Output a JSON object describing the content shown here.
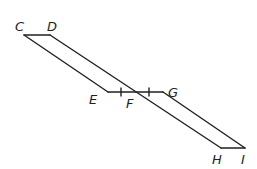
{
  "diagram": {
    "labels": {
      "C": "C",
      "D": "D",
      "E": "E",
      "F": "F",
      "G": "G",
      "H": "H",
      "I": "I"
    },
    "points": {
      "C": [
        24,
        35
      ],
      "D": [
        50,
        35
      ],
      "E": [
        108,
        92
      ],
      "F": [
        133,
        92
      ],
      "G": [
        163,
        92
      ],
      "H": [
        221,
        148
      ],
      "I": [
        245,
        148
      ]
    },
    "segments": [
      [
        "C",
        "D"
      ],
      [
        "C",
        "E"
      ],
      [
        "E",
        "G"
      ],
      [
        "D",
        "H"
      ],
      [
        "G",
        "I"
      ],
      [
        "H",
        "I"
      ]
    ],
    "tick_marks": "EF ≅ FG",
    "stroke_color": "#231f20"
  }
}
